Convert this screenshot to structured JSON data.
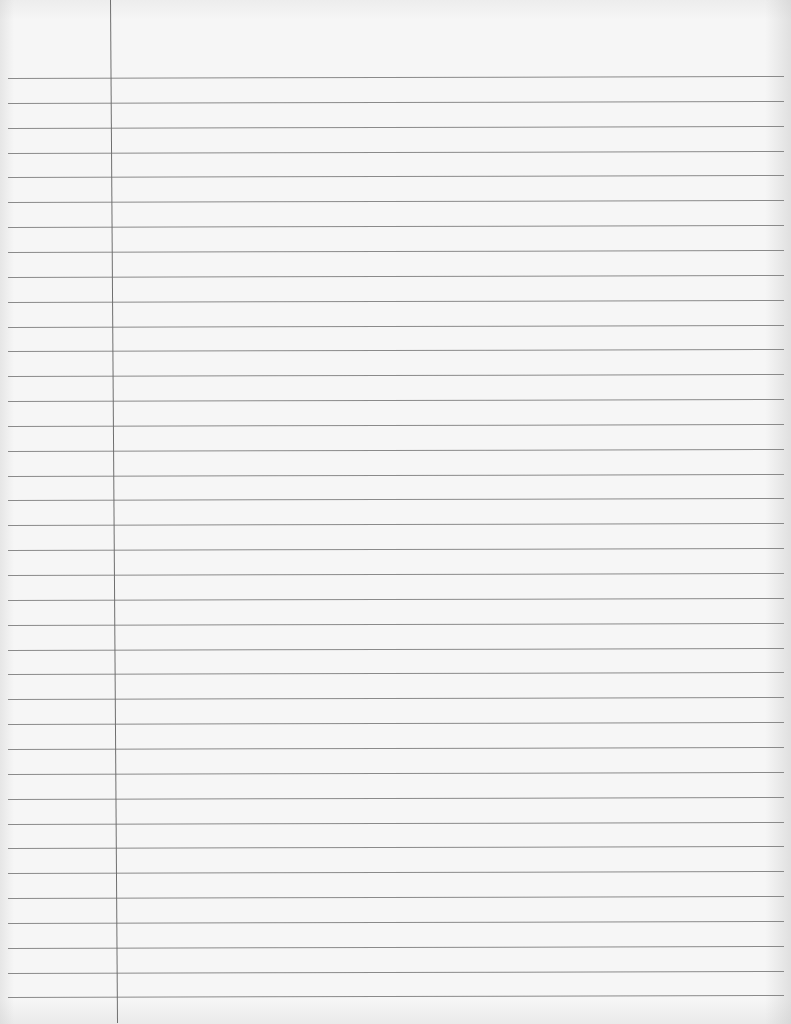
{
  "page": {
    "type": "lined-notebook-paper",
    "background_color": "#f6f6f6",
    "line_color": "#8a8a8a",
    "margin_line_color": "#6f6f6f"
  },
  "rules": {
    "count": 38,
    "first_y_left": 78,
    "first_y_right": 76,
    "spacing": 24.85,
    "x_start": 8,
    "x_end": 784
  },
  "margin_line": {
    "x_top": 110,
    "x_bottom": 117
  },
  "content": {
    "text": ""
  }
}
